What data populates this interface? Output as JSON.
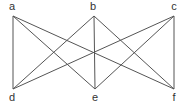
{
  "graph": {
    "name": "K3,3 bipartite graph",
    "nodes": [
      {
        "id": "a",
        "label": "a",
        "x": 13,
        "y": 16,
        "lx": 12,
        "ly": 10
      },
      {
        "id": "b",
        "label": "b",
        "x": 94,
        "y": 16,
        "lx": 93,
        "ly": 10
      },
      {
        "id": "c",
        "label": "c",
        "x": 174,
        "y": 16,
        "lx": 174,
        "ly": 10
      },
      {
        "id": "d",
        "label": "d",
        "x": 13,
        "y": 89,
        "lx": 12,
        "ly": 101
      },
      {
        "id": "e",
        "label": "e",
        "x": 95,
        "y": 89,
        "lx": 95,
        "ly": 101
      },
      {
        "id": "f",
        "label": "f",
        "x": 174,
        "y": 89,
        "lx": 174,
        "ly": 101
      }
    ],
    "edges": [
      [
        "a",
        "d"
      ],
      [
        "a",
        "e"
      ],
      [
        "a",
        "f"
      ],
      [
        "b",
        "d"
      ],
      [
        "b",
        "e"
      ],
      [
        "b",
        "f"
      ],
      [
        "c",
        "d"
      ],
      [
        "c",
        "e"
      ],
      [
        "c",
        "f"
      ]
    ],
    "stroke_color": "#555555"
  }
}
